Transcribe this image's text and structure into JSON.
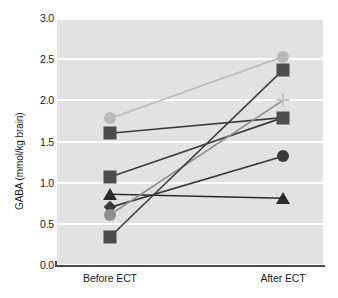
{
  "chart_data": {
    "type": "line",
    "title": "",
    "subtitle": "",
    "xlabel": "",
    "ylabel": "GABA (mmol/kg brain)",
    "categories": [
      "Before ECT",
      "After ECT"
    ],
    "x_tick_labels": [
      "Before ECT",
      "After ECT"
    ],
    "y_tick_labels": [
      "0.0",
      "0.5",
      "1.0",
      "1.5",
      "2.0",
      "2.5",
      "3.0"
    ],
    "y_ticks": [
      0.0,
      0.5,
      1.0,
      1.5,
      2.0,
      2.5,
      3.0
    ],
    "ylim": [
      0.0,
      3.1
    ],
    "grid": "horizontal-white-on-gray",
    "legend": "none",
    "legend_position": "none",
    "plot_background": "#e2e2e2",
    "series": [
      {
        "name": "subject-1",
        "marker": "circle",
        "color": "#b9b9b9",
        "line_color": "#b9b9b9",
        "values": [
          1.78,
          2.53
        ]
      },
      {
        "name": "subject-2",
        "marker": "square",
        "color": "#4d4d4d",
        "line_color": "#3f3f3f",
        "values": [
          1.6,
          1.79
        ]
      },
      {
        "name": "subject-3",
        "marker": "square",
        "color": "#4d4d4d",
        "line_color": "#3f3f3f",
        "values": [
          1.07,
          1.79
        ]
      },
      {
        "name": "subject-4",
        "marker": "triangle",
        "color": "#2b2b2b",
        "line_color": "#2b2b2b",
        "values": [
          0.86,
          0.81
        ]
      },
      {
        "name": "subject-5",
        "marker": "diamond",
        "color": "#3a3a3a",
        "line_color": "#3a3a3a",
        "values": [
          0.7,
          1.32
        ]
      },
      {
        "name": "subject-6",
        "marker": "circle",
        "color": "#8f8f8f",
        "line_color": "#8f8f8f",
        "values": [
          0.61,
          2.0
        ]
      },
      {
        "name": "subject-7",
        "marker": "square",
        "color": "#4d4d4d",
        "line_color": "#3f3f3f",
        "values": [
          0.34,
          2.37
        ]
      }
    ],
    "endpoint_markers_after": [
      {
        "name": "after-circle-light",
        "marker": "circle",
        "color": "#b9b9b9",
        "value": 2.53
      },
      {
        "name": "after-square-dark-top",
        "marker": "square",
        "color": "#4d4d4d",
        "value": 2.37
      },
      {
        "name": "after-cross-light",
        "marker": "cross",
        "color": "#c6c6c6",
        "value": 2.0
      },
      {
        "name": "after-square-dark-mid",
        "marker": "square",
        "color": "#4d4d4d",
        "value": 1.79
      },
      {
        "name": "after-circle-dark",
        "marker": "circle",
        "color": "#3a3a3a",
        "value": 1.32
      },
      {
        "name": "after-triangle-dark",
        "marker": "triangle",
        "color": "#2b2b2b",
        "value": 0.81
      }
    ]
  },
  "axis": {
    "y_title": "GABA (mmol/kg brain)",
    "ticks": {
      "t0": "0.0",
      "t1": "0.5",
      "t2": "1.0",
      "t3": "1.5",
      "t4": "2.0",
      "t5": "2.5",
      "t6": "3.0"
    },
    "x": {
      "before": "Before ECT",
      "after": "After ECT"
    }
  },
  "colors": {
    "plot_bg": "#e2e2e2",
    "gridline": "#ffffff",
    "axis": "#4a4a4a",
    "text": "#1a1a1a",
    "dark_marker": "#4d4d4d",
    "light_marker": "#b9b9b9"
  }
}
